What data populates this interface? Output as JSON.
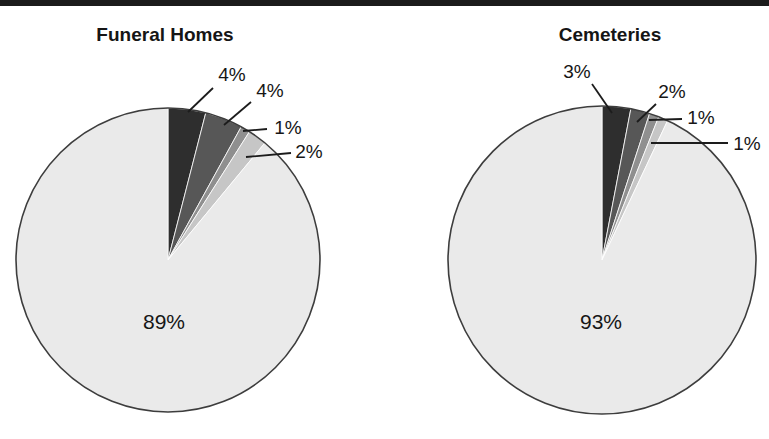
{
  "figure": {
    "background_color": "#ffffff",
    "top_rule_color": "#1b1b1b",
    "text_color": "#161616",
    "outline_color": "#3d3d3d"
  },
  "chart_data": [
    {
      "type": "pie",
      "title": "Funeral Homes",
      "direction": "clockwise",
      "start_angle_deg": 0,
      "legend": "none",
      "slices": [
        {
          "label": "4%",
          "value": 4,
          "color": "#2e2e2e",
          "label_placement": "callout"
        },
        {
          "label": "4%",
          "value": 4,
          "color": "#575757",
          "label_placement": "callout"
        },
        {
          "label": "1%",
          "value": 1,
          "color": "#8f8f8f",
          "label_placement": "callout"
        },
        {
          "label": "2%",
          "value": 2,
          "color": "#c6c6c6",
          "label_placement": "callout"
        },
        {
          "label": "89%",
          "value": 89,
          "color": "#eaeaea",
          "label_placement": "inside"
        }
      ]
    },
    {
      "type": "pie",
      "title": "Cemeteries",
      "direction": "clockwise",
      "start_angle_deg": 0,
      "legend": "none",
      "slices": [
        {
          "label": "3%",
          "value": 3,
          "color": "#2e2e2e",
          "label_placement": "callout"
        },
        {
          "label": "2%",
          "value": 2,
          "color": "#575757",
          "label_placement": "callout"
        },
        {
          "label": "1%",
          "value": 1,
          "color": "#8f8f8f",
          "label_placement": "callout"
        },
        {
          "label": "1%",
          "value": 1,
          "color": "#c6c6c6",
          "label_placement": "callout"
        },
        {
          "label": "93%",
          "value": 93,
          "color": "#eaeaea",
          "label_placement": "inside"
        }
      ]
    }
  ]
}
